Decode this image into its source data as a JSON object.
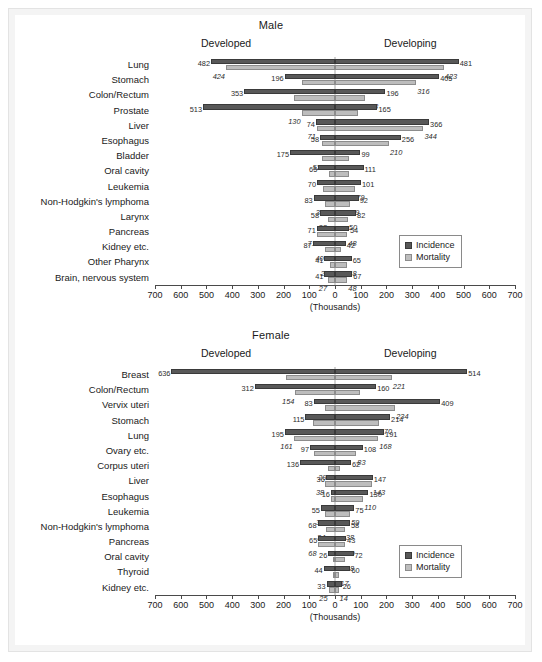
{
  "figure": {
    "units_label": "(Thousands)",
    "left_region_label": "Developed",
    "right_region_label": "Developing",
    "legend": {
      "incidence": "Incidence",
      "mortality": "Mortality"
    },
    "colors": {
      "incidence": "#585858",
      "mortality": "#bdbdbd",
      "axis": "#4a4a4a",
      "frame": "#f4f4f4"
    },
    "axis": {
      "ticks": [
        700,
        600,
        500,
        400,
        300,
        200,
        100,
        0,
        100,
        200,
        300,
        400,
        500,
        600,
        700
      ],
      "max": 700,
      "min": 0
    }
  },
  "chart_data": [
    {
      "type": "bar",
      "title": "Male",
      "orientation": "horizontal-diverging",
      "xlabel": "(Thousands)",
      "ylabel": "",
      "xlim": [
        -700,
        700
      ],
      "grid": false,
      "legend_position": "bottom-right",
      "left_group": "Developed",
      "right_group": "Developing",
      "series": [
        "Incidence",
        "Mortality"
      ],
      "categories": [
        "Lung",
        "Stomach",
        "Colon/Rectum",
        "Prostate",
        "Liver",
        "Esophagus",
        "Bladder",
        "Oral cavity",
        "Leukemia",
        "Non-Hodgkin's lymphoma",
        "Larynx",
        "Pancreas",
        "Kidney etc.",
        "Other Pharynx",
        "Brain, nervous system"
      ],
      "developed_incidence": [
        482,
        196,
        353,
        513,
        74,
        58,
        175,
        65,
        70,
        83,
        58,
        71,
        87,
        41,
        41
      ],
      "developed_mortality": [
        424,
        129,
        160,
        130,
        71,
        50,
        52,
        22,
        46,
        39,
        28,
        71,
        40,
        20,
        27
      ],
      "developing_incidence": [
        481,
        405,
        196,
        165,
        366,
        256,
        99,
        111,
        101,
        92,
        82,
        54,
        42,
        65,
        67
      ],
      "developing_mortality": [
        423,
        316,
        118,
        91,
        344,
        210,
        56,
        56,
        79,
        59,
        50,
        48,
        22,
        48,
        48
      ]
    },
    {
      "type": "bar",
      "title": "Female",
      "orientation": "horizontal-diverging",
      "xlabel": "(Thousands)",
      "ylabel": "",
      "xlim": [
        -700,
        700
      ],
      "grid": false,
      "legend_position": "bottom-right",
      "left_group": "Developed",
      "right_group": "Developing",
      "series": [
        "Incidence",
        "Mortality"
      ],
      "categories": [
        "Breast",
        "Colon/Rectum",
        "Vervix uteri",
        "Stomach",
        "Lung",
        "Ovary etc.",
        "Corpus uteri",
        "Liver",
        "Esophagus",
        "Leukemia",
        "Non-Hodgkin's lymphoma",
        "Pancreas",
        "Oral cavity",
        "Thyroid",
        "Kidney etc."
      ],
      "developed_incidence": [
        636,
        312,
        83,
        115,
        195,
        97,
        136,
        36,
        16,
        55,
        68,
        65,
        26,
        44,
        33
      ],
      "developed_mortality": [
        190,
        154,
        40,
        84,
        161,
        82,
        29,
        38,
        15,
        38,
        34,
        68,
        8,
        7,
        25
      ],
      "developing_incidence": [
        514,
        160,
        409,
        214,
        191,
        108,
        62,
        147,
        130,
        75,
        58,
        43,
        72,
        60,
        26
      ],
      "developing_mortality": [
        221,
        96,
        234,
        170,
        168,
        83,
        21,
        143,
        110,
        59,
        38,
        40,
        38,
        17,
        14
      ]
    }
  ]
}
